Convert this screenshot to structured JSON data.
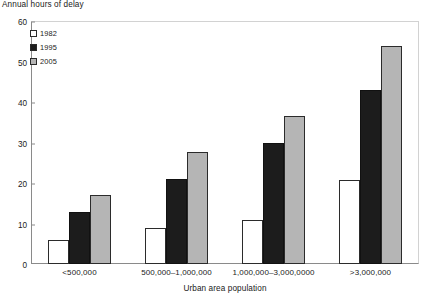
{
  "chart_data": {
    "type": "bar",
    "title": "",
    "ylabel": "Annual hours of delay",
    "xlabel": "Urban area population",
    "ylim": [
      0,
      60
    ],
    "yticks": [
      0,
      10,
      20,
      30,
      40,
      50,
      60
    ],
    "ytick_labels": [
      "0",
      "10",
      "20",
      "30",
      "40",
      "50",
      "60"
    ],
    "grid": false,
    "legend_position": "top-left",
    "categories": [
      "<500,000",
      "500,000–1,000,000",
      "1,000,000–3,000,0000",
      ">3,000,000"
    ],
    "series": [
      {
        "name": "1982",
        "color": "#ffffff",
        "values": [
          6,
          9,
          10.8,
          20.7
        ]
      },
      {
        "name": "1995",
        "color": "#1c1c1c",
        "values": [
          12.8,
          20.9,
          29.8,
          43
        ]
      },
      {
        "name": "2005",
        "color": "#b5b5b5",
        "values": [
          17,
          27.7,
          36.6,
          53.8
        ]
      }
    ]
  }
}
